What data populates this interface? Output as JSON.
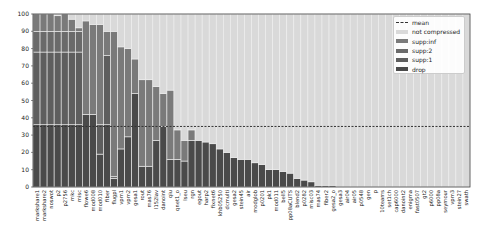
{
  "chart_data": {
    "type": "bar",
    "stacked": true,
    "title": "",
    "xlabel": "",
    "ylabel": "",
    "ylim": [
      0,
      100
    ],
    "yticks": [
      0,
      10,
      20,
      30,
      40,
      50,
      60,
      70,
      80,
      90,
      100
    ],
    "mean": 35,
    "legend": [
      "mean",
      "not compressed",
      "supp:inf",
      "supp:2",
      "supp:1",
      "drop"
    ],
    "legend_position": "upper right",
    "colors": {
      "not compressed": "#d9d9d9",
      "supp:inf": "#7a7a7a",
      "supp:2": "#6a6a6a",
      "supp:1": "#5e5e5e",
      "drop": "#4a4a4a",
      "mean": "#333333"
    },
    "categories": [
      "markshare1",
      "markshare2",
      "noswot",
      "p2",
      "p2756",
      "mkc",
      "misc",
      "flowe6",
      "mod008",
      "mod010",
      "fiber",
      "flugpl",
      "vpm1",
      "vpm2",
      "gesa1",
      "rout",
      "mas76",
      "l152lav",
      "danoint",
      "qiu",
      "qnet1_o",
      "lseu",
      "rgn",
      "egout",
      "harp2",
      "fixnet6",
      "khb05250",
      "dcmulti",
      "gesa2",
      "stein45",
      "air",
      "modglob",
      "p0201",
      "pk1",
      "mod011",
      "bell5",
      "pp08aCUTS",
      "blend2",
      "p0282",
      "misc03",
      "mas74",
      "fiber2",
      "gesa2_o",
      "gesa3",
      "air04",
      "air05",
      "p0548",
      "gen",
      "p",
      "10teams",
      "set1ch",
      "cap6000",
      "danoint2",
      "enigma",
      "fast0507",
      "gt2",
      "p6000",
      "pp08a",
      "seymour",
      "vpm3",
      "stein27",
      "swath"
    ],
    "series": [
      {
        "name": "drop",
        "values": [
          36,
          36,
          36,
          36,
          36,
          36,
          36,
          42,
          42,
          19,
          36,
          5,
          22,
          29,
          54,
          12,
          12,
          27,
          35,
          16,
          16,
          15,
          27,
          27,
          26,
          25,
          22,
          20,
          17,
          16,
          16,
          14,
          13,
          10,
          10,
          9,
          8,
          5,
          4,
          3,
          1,
          1,
          1,
          0,
          0,
          0,
          0,
          0,
          0,
          0,
          0,
          0,
          0,
          0,
          0,
          0,
          0,
          0,
          0,
          0,
          0,
          0
        ]
      },
      {
        "name": "supp:1",
        "values": [
          42,
          42,
          42,
          42,
          42,
          42,
          42,
          0,
          0,
          17,
          40,
          0,
          0,
          0,
          0,
          0,
          0,
          0,
          0,
          0,
          0,
          0,
          0,
          0,
          0,
          0,
          0,
          0,
          0,
          0,
          0,
          0,
          0,
          0,
          0,
          0,
          0,
          0,
          0,
          0,
          0,
          0,
          0,
          0,
          0,
          0,
          0,
          0,
          0,
          0,
          0,
          0,
          0,
          0,
          0,
          0,
          0,
          0,
          0,
          0,
          0,
          0
        ]
      },
      {
        "name": "supp:2",
        "values": [
          12,
          12,
          12,
          12,
          12,
          12,
          12,
          0,
          0,
          0,
          0,
          1,
          0,
          0,
          0,
          0,
          0,
          0,
          0,
          0,
          0,
          0,
          0,
          0,
          0,
          0,
          0,
          0,
          0,
          0,
          0,
          0,
          0,
          0,
          0,
          0,
          0,
          0,
          0,
          0,
          0,
          0,
          0,
          0,
          0,
          0,
          0,
          0,
          0,
          0,
          0,
          0,
          0,
          0,
          0,
          0,
          0,
          0,
          0,
          0,
          0,
          0
        ]
      },
      {
        "name": "supp:inf",
        "values": [
          10,
          10,
          10,
          9,
          10,
          7,
          2,
          54,
          52,
          58,
          14,
          84,
          59,
          51,
          20,
          50,
          50,
          31,
          19,
          40,
          17,
          12,
          6,
          0,
          0,
          0,
          0,
          0,
          0,
          0,
          0,
          0,
          0,
          0,
          0,
          0,
          0,
          0,
          0,
          0,
          0,
          0,
          0,
          0,
          0,
          0,
          0,
          0,
          0,
          0,
          0,
          0,
          0,
          0,
          0,
          0,
          0,
          0,
          0,
          0,
          0,
          0
        ]
      },
      {
        "name": "not compressed",
        "values": [
          0,
          0,
          0,
          1,
          0,
          3,
          8,
          4,
          6,
          6,
          10,
          10,
          19,
          20,
          26,
          38,
          38,
          42,
          46,
          44,
          67,
          73,
          67,
          73,
          74,
          75,
          78,
          80,
          83,
          84,
          84,
          86,
          87,
          90,
          90,
          91,
          92,
          95,
          96,
          97,
          99,
          99,
          99,
          100,
          100,
          100,
          100,
          100,
          100,
          100,
          100,
          100,
          100,
          100,
          100,
          100,
          100,
          100,
          100,
          100,
          100,
          100
        ]
      }
    ],
    "totals_compressed_pct": [
      100,
      100,
      100,
      99,
      100,
      97,
      92,
      96,
      94,
      94,
      90,
      90,
      81,
      80,
      74,
      62,
      62,
      58,
      54,
      56,
      33,
      27,
      33,
      27,
      26,
      25,
      22,
      20,
      17,
      16,
      16,
      14,
      13,
      10,
      10,
      9,
      8,
      5,
      4,
      3,
      1,
      1,
      1,
      0,
      0,
      0,
      0,
      0,
      0,
      0,
      0,
      0,
      0,
      0,
      0,
      0,
      0,
      0,
      0,
      0,
      0,
      0
    ],
    "grid": false
  }
}
